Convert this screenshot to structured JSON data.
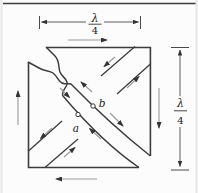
{
  "diagram": {
    "dimensions": {
      "top": {
        "numerator": "λ",
        "denominator": "4"
      },
      "right": {
        "numerator": "λ",
        "denominator": "4"
      }
    },
    "terminals": {
      "a": "a",
      "b": "b"
    },
    "current_arrows": [
      "top-edge-right",
      "right-edge-down",
      "bottom-edge-left",
      "left-edge-up",
      "slot-upper-edge-up-left",
      "slot-upper-edge-down-right",
      "slot-lower-edge-down-right",
      "slot-lower-edge-up-left",
      "top-right-corner-down-left",
      "top-right-corner-up-right",
      "bottom-left-corner-up-right",
      "bottom-left-corner-down-left"
    ],
    "colors": {
      "background": "#fcfcfc",
      "line": "#3c3c3c",
      "arrow-shaft": "#999999",
      "arrow-head": "#333333",
      "dim": "#4a4a4a"
    }
  }
}
